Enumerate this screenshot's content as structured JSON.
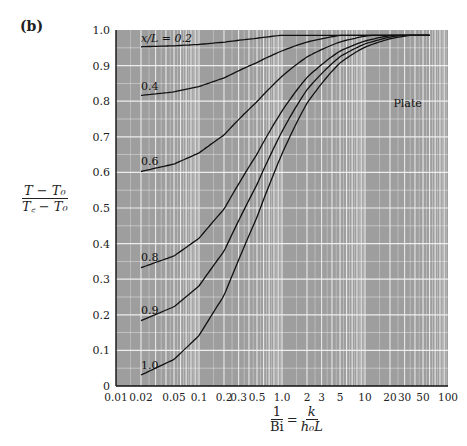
{
  "panel_label": "(b)",
  "y_title": {
    "numerator": "T − T₀",
    "denominator": "T꜀ − T₀"
  },
  "x_title": {
    "lhs_num": "1",
    "lhs_den": "Bi",
    "eq": "=",
    "rhs_num": "k",
    "rhs_den": "h₀L"
  },
  "plot_label": "Plate",
  "colors": {
    "plot_bg": "#9e9e9e",
    "grid": "#f2f2f2",
    "curve": "#111111",
    "axis": "#111111"
  },
  "chart_data": {
    "type": "line",
    "title": "",
    "xlabel": "1/Bi = k/(h0 L)",
    "ylabel": "(T − T0)/(Tc − T0)",
    "xscale": "log",
    "xlim": [
      0.01,
      100
    ],
    "ylim": [
      0,
      1.0
    ],
    "grid": true,
    "xticks": [
      "0.01",
      "0.02",
      "0.05",
      "0.1",
      "0.2",
      "0.3",
      "0.5",
      "1.0",
      "2",
      "3",
      "5",
      "10",
      "20",
      "30",
      "50",
      "100"
    ],
    "yticks": [
      "0",
      "0.1",
      "0.2",
      "0.3",
      "0.4",
      "0.5",
      "0.6",
      "0.7",
      "0.8",
      "0.9",
      "1.0"
    ],
    "annotation": "Plate",
    "x": [
      0.02,
      0.05,
      0.1,
      0.2,
      0.5,
      1.0,
      2,
      5,
      10,
      20,
      50
    ],
    "lambda1": [
      1.54,
      1.4961,
      1.4289,
      1.3138,
      1.0769,
      0.8603,
      0.6533,
      0.4328,
      0.3111,
      0.2218,
      0.141
    ],
    "series": [
      {
        "name": "x/L = 0.2",
        "label": "x/L = 0.2",
        "values": [
          0.95,
          0.955,
          0.959,
          0.965,
          0.977,
          0.985,
          0.991,
          0.996,
          0.998,
          0.999,
          1.0
        ]
      },
      {
        "name": "0.4",
        "label": "0.4",
        "values": [
          0.815,
          0.826,
          0.842,
          0.863,
          0.907,
          0.941,
          0.966,
          0.985,
          0.992,
          0.996,
          0.998
        ]
      },
      {
        "name": "0.6",
        "label": "0.6",
        "values": [
          0.603,
          0.623,
          0.653,
          0.703,
          0.797,
          0.87,
          0.924,
          0.966,
          0.983,
          0.991,
          0.996
        ]
      },
      {
        "name": "0.8",
        "label": "0.8",
        "values": [
          0.335,
          0.364,
          0.414,
          0.496,
          0.65,
          0.772,
          0.865,
          0.94,
          0.969,
          0.984,
          0.994
        ]
      },
      {
        "name": "0.9",
        "label": "0.9",
        "values": [
          0.184,
          0.214,
          0.263,
          0.35,
          0.541,
          0.699,
          0.828,
          0.924,
          0.961,
          0.98,
          0.992
        ]
      },
      {
        "name": "1.0",
        "label": "1.0",
        "values": [
          0.031,
          0.075,
          0.141,
          0.254,
          0.474,
          0.652,
          0.794,
          0.908,
          0.952,
          0.976,
          0.99
        ]
      }
    ]
  }
}
